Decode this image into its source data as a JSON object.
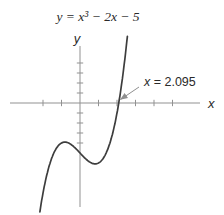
{
  "figure": {
    "title": "y = x³ − 2x − 5",
    "x_axis_label": "x",
    "y_axis_label": "y",
    "annotation_var": "x",
    "annotation_value": " = 2.095"
  },
  "colors": {
    "background": "#ffffff",
    "curve": "#3d3d3d",
    "axis": "#919191",
    "arrow": "#8f8f8f",
    "text": "#2a2a2a"
  },
  "chart_data": {
    "type": "line",
    "title": "y = x³ − 2x − 5",
    "function": "y = x^3 - 2x - 5",
    "coefficients": [
      1,
      0,
      -2,
      -5
    ],
    "x_domain": [
      -2.17,
      2.56
    ],
    "xlabel": "x",
    "ylabel": "y",
    "x_ticks": [
      -2,
      -1,
      1,
      2,
      3,
      4,
      5
    ],
    "y_ticks": [
      -4,
      -3,
      -2,
      -1,
      1,
      2,
      3,
      4
    ],
    "tick_interval": 1,
    "grid": false,
    "legend": false,
    "annotation": "x = 2.095",
    "key_points": {
      "root": [
        2.095,
        0
      ],
      "y_intercept": [
        0,
        -5
      ],
      "local_max": [
        -0.816,
        -3.911
      ],
      "local_min": [
        0.816,
        -6.089
      ]
    }
  }
}
